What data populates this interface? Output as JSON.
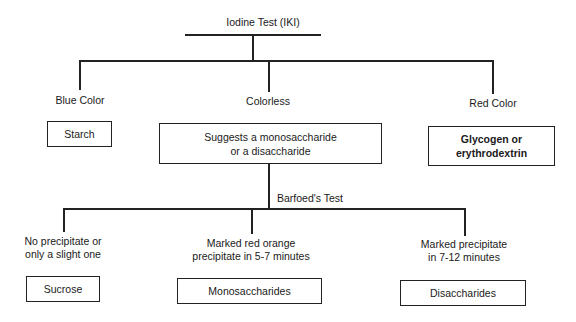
{
  "diagram": {
    "root": {
      "label": "Iodine Test (IKI)"
    },
    "level1": [
      {
        "condition": "Blue Color",
        "result": "Starch"
      },
      {
        "condition": "Colorless",
        "result": "Suggests a monosaccharide or a disaccharide",
        "result_lines": [
          "Suggests a monosaccharide",
          "or a disaccharide"
        ]
      },
      {
        "condition": "Red Color",
        "result": "Glycogen or erythrodextrin",
        "result_lines": [
          "Glycogen or",
          "erythrodextrin"
        ]
      }
    ],
    "secondary_test": {
      "label": "Barfoed's Test"
    },
    "level2": [
      {
        "condition_lines": [
          "No precipitate or",
          "only a slight one"
        ],
        "result": "Sucrose"
      },
      {
        "condition_lines": [
          "Marked red orange",
          "precipitate in 5-7 minutes"
        ],
        "result": "Monosaccharides"
      },
      {
        "condition_lines": [
          "Marked precipitate",
          "in 7-12 minutes"
        ],
        "result": "Disaccharides"
      }
    ]
  },
  "colors": {
    "line": "#222222",
    "background": "#ffffff",
    "text": "#1a1a1a"
  }
}
